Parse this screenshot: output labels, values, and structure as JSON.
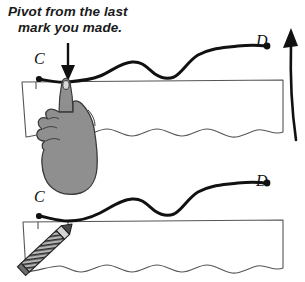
{
  "diagram": {
    "title": "Pivot from the last mark you made.",
    "caption": {
      "line1": "Pivot from the last",
      "line2": "mark you made."
    },
    "colors": {
      "ink": "#111111",
      "paper_outline": "#555555",
      "hand_fill": "#8f8f8f",
      "hand_outline": "#3a3a3a",
      "pencil_fill": "#9a9a9a",
      "pencil_outline": "#222222",
      "background": "#ffffff"
    },
    "panels": [
      {
        "id": "top-panel",
        "name": "pivot-step",
        "description": "Hand pivoting at the last mark on the paper edge",
        "curve_label_start": "C",
        "curve_label_end": "D",
        "annotations": [
          {
            "name": "down-arrow",
            "meaning": "points at the pivot mark"
          },
          {
            "name": "up-arrow",
            "meaning": "paper rotation direction"
          }
        ],
        "tool": "hand"
      },
      {
        "id": "bottom-panel",
        "name": "draw-step",
        "description": "Pencil resuming the line at the same mark",
        "curve_label_start": "C",
        "curve_label_end": "D",
        "annotations": [],
        "tool": "pencil"
      }
    ],
    "labels": {
      "c_top": "C",
      "d_top": "D",
      "c_bottom": "C",
      "d_bottom": "D"
    }
  }
}
